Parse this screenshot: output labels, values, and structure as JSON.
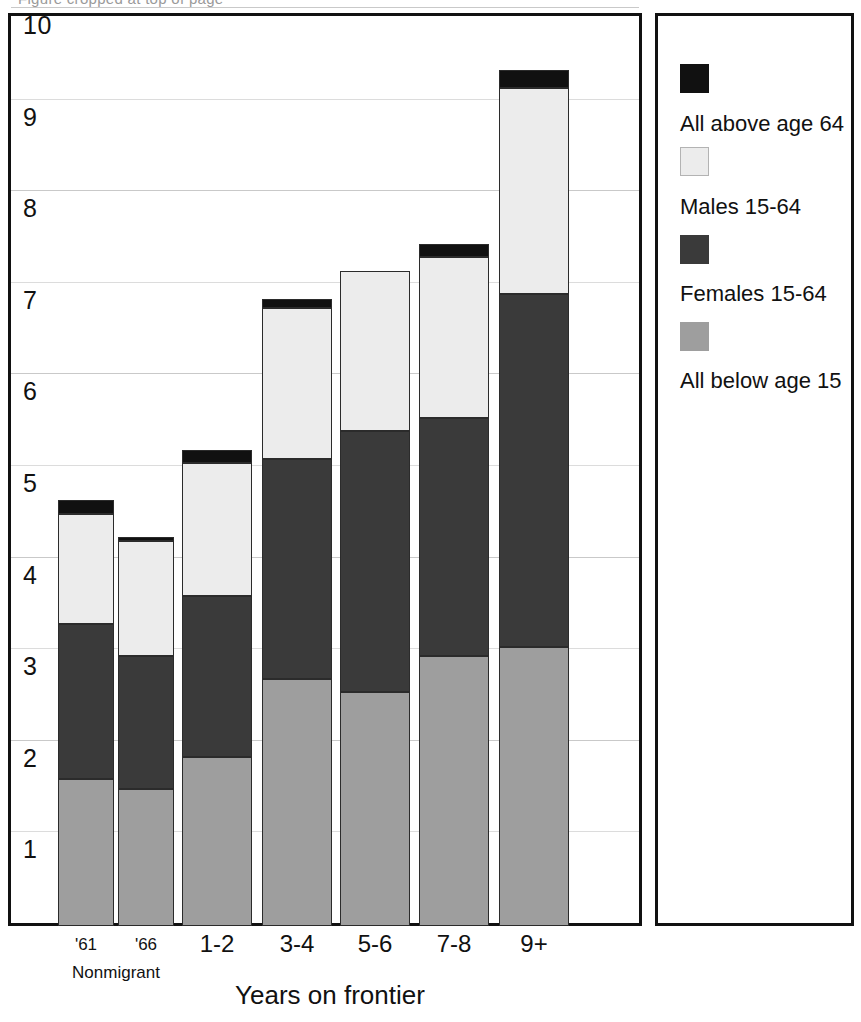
{
  "figure": {
    "title_remnant": "Figure cropped at top of page",
    "xaxis_title": "Years on frontier",
    "nonmigrant_group_label": "Nonmigrant"
  },
  "legend": {
    "items": [
      {
        "label": "All above age 64",
        "key": "above64",
        "color": "#111111"
      },
      {
        "label": "Males 15-64",
        "key": "males",
        "color": "#ececec"
      },
      {
        "label": "Females 15-64",
        "key": "females",
        "color": "#3a3a3a"
      },
      {
        "label": "All below age 15",
        "key": "below15",
        "color": "#9e9e9e"
      }
    ]
  },
  "yaxis": {
    "ticks": [
      "1",
      "2",
      "3",
      "4",
      "5",
      "6",
      "7",
      "8",
      "9",
      "10"
    ],
    "min": 0,
    "max": 10
  },
  "chart_data": {
    "type": "bar",
    "subtype": "stacked",
    "title": "",
    "xlabel": "Years on frontier",
    "ylabel": "",
    "ylim": [
      0,
      10
    ],
    "grid": true,
    "legend_position": "right",
    "categories": [
      "'61",
      "'66",
      "1-2",
      "3-4",
      "5-6",
      "7-8",
      "9+"
    ],
    "category_groups": [
      {
        "label": "Nonmigrant",
        "categories": [
          "'61",
          "'66"
        ]
      }
    ],
    "series": [
      {
        "name": "All below age 15",
        "color": "#9e9e9e",
        "values": [
          1.6,
          1.5,
          1.85,
          2.7,
          2.55,
          2.95,
          3.05
        ]
      },
      {
        "name": "Females 15-64",
        "color": "#3a3a3a",
        "values": [
          1.7,
          1.45,
          1.75,
          2.4,
          2.85,
          2.6,
          3.85
        ]
      },
      {
        "name": "Males 15-64",
        "color": "#ececec",
        "values": [
          1.2,
          1.25,
          1.45,
          1.65,
          1.75,
          1.75,
          2.25
        ]
      },
      {
        "name": "All above age 64",
        "color": "#111111",
        "values": [
          0.15,
          0.05,
          0.15,
          0.1,
          0.0,
          0.15,
          0.2
        ]
      }
    ],
    "totals": [
      4.65,
      4.25,
      5.2,
      6.85,
      7.15,
      7.45,
      9.35
    ]
  },
  "layout": {
    "plot_left": 8,
    "plot_top": 13,
    "plot_width": 634,
    "plot_height": 913,
    "baseline_y": 910,
    "unit_px": 91.6,
    "bar_x": [
      58,
      118,
      182,
      262,
      340,
      419,
      499
    ],
    "bar_width": [
      56,
      56,
      70,
      70,
      70,
      70,
      70
    ]
  }
}
